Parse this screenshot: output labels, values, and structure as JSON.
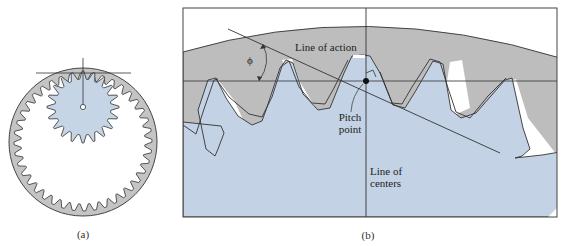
{
  "figure": {
    "panel_a": {
      "caption": "(a)",
      "ring_gear": {
        "teeth_count": 40,
        "fill": "#c8c8c8"
      },
      "pinion": {
        "teeth_count": 20,
        "fill": "#c5d5e6"
      }
    },
    "panel_b": {
      "caption": "(b)",
      "labels": {
        "line_of_action": "Line of action",
        "pressure_angle": "ϕ",
        "pitch_point_line1": "Pitch",
        "pitch_point_line2": "point",
        "line_of_centers_line1": "Line of",
        "line_of_centers_line2": "centers"
      }
    },
    "colors": {
      "ring_gray": "#bdbdbd",
      "pinion_blue": "#c3d3e5",
      "outline": "#333333",
      "background": "#ffffff"
    }
  }
}
